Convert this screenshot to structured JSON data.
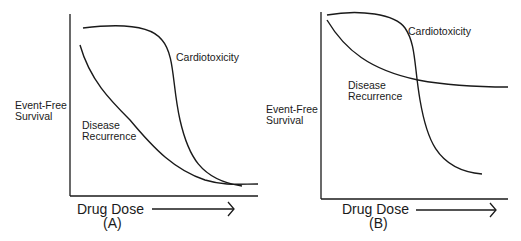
{
  "panels": [
    {
      "id": "A",
      "panel_label": "(A)",
      "y_axis_label_line1": "Event-Free",
      "y_axis_label_line2": "Survival",
      "x_axis_label": "Drug Dose",
      "curves": [
        {
          "name": "Cardiotoxicity",
          "label": "Cardiotoxicity"
        },
        {
          "name": "Disease Recurrence",
          "label_line1": "Disease",
          "label_line2": "Recurrence"
        }
      ]
    },
    {
      "id": "B",
      "panel_label": "(B)",
      "y_axis_label_line1": "Event-Free",
      "y_axis_label_line2": "Survival",
      "x_axis_label": "Drug Dose",
      "curves": [
        {
          "name": "Cardiotoxicity",
          "label": "Cardiotoxicity"
        },
        {
          "name": "Disease Recurrence",
          "label_line1": "Disease",
          "label_line2": "Recurrence"
        }
      ]
    }
  ],
  "colors": {
    "line": "#1a1a1a",
    "background": "#ffffff"
  }
}
